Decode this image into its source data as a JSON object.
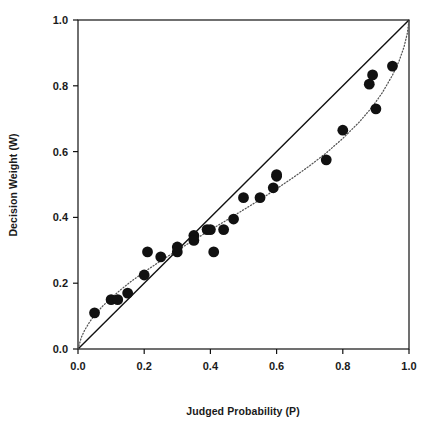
{
  "chart_data": {
    "type": "scatter",
    "title": "",
    "xlabel": "Judged Probability (P)",
    "ylabel": "Decision Weight (W)",
    "xlim": [
      0.0,
      1.0
    ],
    "ylim": [
      0.0,
      1.0
    ],
    "xticks": [
      "0.0",
      "0.2",
      "0.4",
      "0.6",
      "0.8",
      "1.0"
    ],
    "xtick_values": [
      0.0,
      0.2,
      0.4,
      0.6,
      0.8,
      1.0
    ],
    "yticks": [
      "0.0",
      "0.2",
      "0.4",
      "0.6",
      "0.8",
      "1.0"
    ],
    "ytick_values": [
      0.0,
      0.2,
      0.4,
      0.6,
      0.8,
      1.0
    ],
    "grid": false,
    "legend": null,
    "marker": {
      "shape": "filled-circle",
      "color": "#111111",
      "size": 5.4
    },
    "series": [
      {
        "name": "Observed decision weights",
        "type": "scatter",
        "points": [
          [
            0.05,
            0.11
          ],
          [
            0.1,
            0.15
          ],
          [
            0.12,
            0.15
          ],
          [
            0.15,
            0.17
          ],
          [
            0.2,
            0.225
          ],
          [
            0.21,
            0.295
          ],
          [
            0.25,
            0.28
          ],
          [
            0.3,
            0.295
          ],
          [
            0.3,
            0.31
          ],
          [
            0.35,
            0.345
          ],
          [
            0.35,
            0.33
          ],
          [
            0.39,
            0.363
          ],
          [
            0.4,
            0.363
          ],
          [
            0.41,
            0.295
          ],
          [
            0.44,
            0.363
          ],
          [
            0.47,
            0.395
          ],
          [
            0.5,
            0.46
          ],
          [
            0.55,
            0.46
          ],
          [
            0.59,
            0.49
          ],
          [
            0.6,
            0.525
          ],
          [
            0.6,
            0.53
          ],
          [
            0.75,
            0.575
          ],
          [
            0.8,
            0.665
          ],
          [
            0.88,
            0.805
          ],
          [
            0.89,
            0.833
          ],
          [
            0.9,
            0.73
          ],
          [
            0.95,
            0.86
          ]
        ]
      },
      {
        "name": "Identity line (W = P)",
        "type": "line",
        "style": "solid",
        "color": "#111111",
        "points": [
          [
            0.0,
            0.0
          ],
          [
            1.0,
            1.0
          ]
        ]
      },
      {
        "name": "Fitted weighting function",
        "type": "line",
        "style": "dotted",
        "color": "#555555",
        "points": [
          [
            0.0,
            0.0
          ],
          [
            0.01,
            0.035
          ],
          [
            0.02,
            0.057
          ],
          [
            0.035,
            0.082
          ],
          [
            0.05,
            0.103
          ],
          [
            0.075,
            0.131
          ],
          [
            0.1,
            0.155
          ],
          [
            0.13,
            0.181
          ],
          [
            0.16,
            0.205
          ],
          [
            0.2,
            0.234
          ],
          [
            0.25,
            0.268
          ],
          [
            0.3,
            0.3
          ],
          [
            0.35,
            0.331
          ],
          [
            0.4,
            0.362
          ],
          [
            0.45,
            0.392
          ],
          [
            0.5,
            0.423
          ],
          [
            0.55,
            0.454
          ],
          [
            0.6,
            0.487
          ],
          [
            0.65,
            0.521
          ],
          [
            0.7,
            0.557
          ],
          [
            0.75,
            0.596
          ],
          [
            0.8,
            0.64
          ],
          [
            0.85,
            0.69
          ],
          [
            0.89,
            0.737
          ],
          [
            0.92,
            0.78
          ],
          [
            0.95,
            0.832
          ],
          [
            0.97,
            0.875
          ],
          [
            0.985,
            0.918
          ],
          [
            0.995,
            0.96
          ],
          [
            1.0,
            1.0
          ]
        ]
      }
    ]
  },
  "axes": {
    "frame_color": "#111111",
    "background": "#ffffff"
  }
}
